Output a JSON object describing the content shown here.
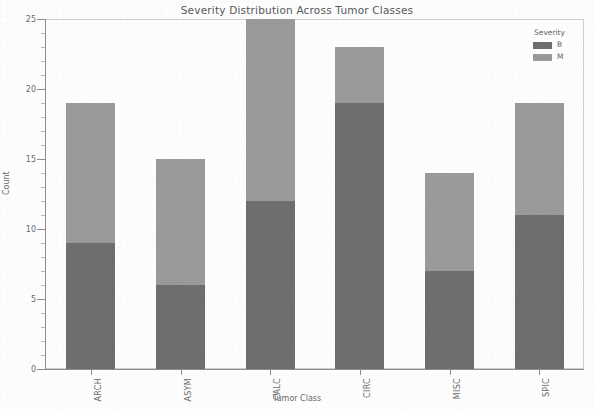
{
  "chart_data": {
    "type": "bar",
    "title": "Severity Distribution Across Tumor Classes",
    "xlabel": "Tumor Class",
    "ylabel": "Count",
    "categories": [
      "ARCH",
      "ASYM",
      "CALC",
      "CIRC",
      "MISC",
      "SPIC"
    ],
    "series": [
      {
        "name": "B",
        "values": [
          9,
          6,
          12,
          19,
          7,
          11
        ],
        "color": "#6e6e6e"
      },
      {
        "name": "M",
        "values": [
          10,
          9,
          13,
          4,
          7,
          8
        ],
        "color": "#9a9a9a"
      }
    ],
    "totals": [
      19,
      15,
      25,
      23,
      14,
      19
    ],
    "stacked": true,
    "ylim": [
      0,
      25
    ],
    "yticks": [
      0,
      5,
      10,
      15,
      20,
      25
    ],
    "ytick_labels": [
      "0",
      "5",
      "10",
      "15",
      "20",
      "25"
    ],
    "grid": false,
    "legend": {
      "title": "Severity",
      "position": "upper right",
      "entries": [
        {
          "label": "B",
          "color": "#6e6e6e"
        },
        {
          "label": "M",
          "color": "#9a9a9a"
        }
      ]
    }
  }
}
